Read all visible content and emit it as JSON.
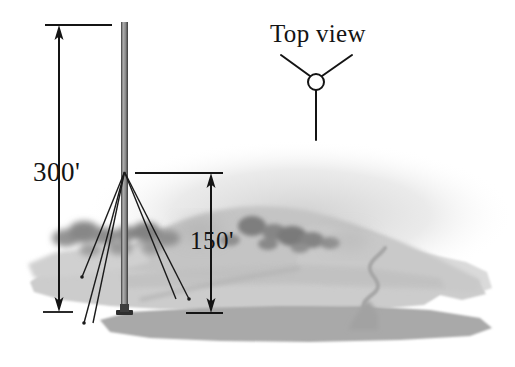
{
  "figure": {
    "kind": "engineering-illustration",
    "background_color": "#ffffff"
  },
  "labels": {
    "tower_height": "300'",
    "guy_attachment_height": "150'",
    "top_view_title": "Top view"
  },
  "colors": {
    "line": "#141414",
    "text": "#141414",
    "terrain_light": "#d4d4d4",
    "terrain_mid": "#bdbdbd",
    "terrain_dark": "#a8a8a8",
    "terrain_shadow": "#9a9a9a",
    "hill": "#c2c2c2",
    "tree_dark": "#8a8a8a",
    "tree_soft": "#9e9e9e",
    "river": "#a0a0a0",
    "tower_body": "#8f8f8f",
    "tower_edge": "#2a2a2a"
  },
  "elevation_view": {
    "tower": {
      "x_left": 121,
      "x_right": 128,
      "top_y": 22,
      "base_y": 313,
      "base_plate": {
        "x": 117,
        "y": 311,
        "width": 16,
        "height": 6
      }
    },
    "guy_attachment_point": {
      "x": 124.5,
      "y": 172
    },
    "guy_anchors": [
      {
        "name": "guy-anchor-left-near",
        "x": 82,
        "y": 277
      },
      {
        "name": "guy-anchor-left-far",
        "x": 84,
        "y": 323
      },
      {
        "name": "guy-anchor-right",
        "x": 189,
        "y": 299
      }
    ],
    "dimension_300": {
      "arrow_x": 59,
      "top_y": 25,
      "bottom_y": 312,
      "top_extension": {
        "x1": 45,
        "x2": 112
      },
      "bottom_extension": {
        "x1": 43,
        "x2": 73
      }
    },
    "dimension_150": {
      "arrow_x": 211,
      "top_y": 173,
      "bottom_y": 313,
      "top_extension": {
        "x1": 135,
        "x2": 223
      },
      "bottom_extension": {
        "x1": 186,
        "x2": 223
      }
    }
  },
  "top_view": {
    "hub": {
      "cx": 316,
      "cy": 82,
      "r": 8
    },
    "legs": [
      {
        "name": "top-view-leg-upper-left",
        "x2": 281,
        "y2": 55
      },
      {
        "name": "top-view-leg-upper-right",
        "x2": 352,
        "y2": 55
      },
      {
        "name": "top-view-leg-down",
        "x2": 316,
        "y2": 140
      }
    ]
  },
  "terrain": {
    "trees_left_cluster": 9,
    "trees_right_cluster": 8,
    "river_present": true,
    "hill_crest_y": 208
  }
}
